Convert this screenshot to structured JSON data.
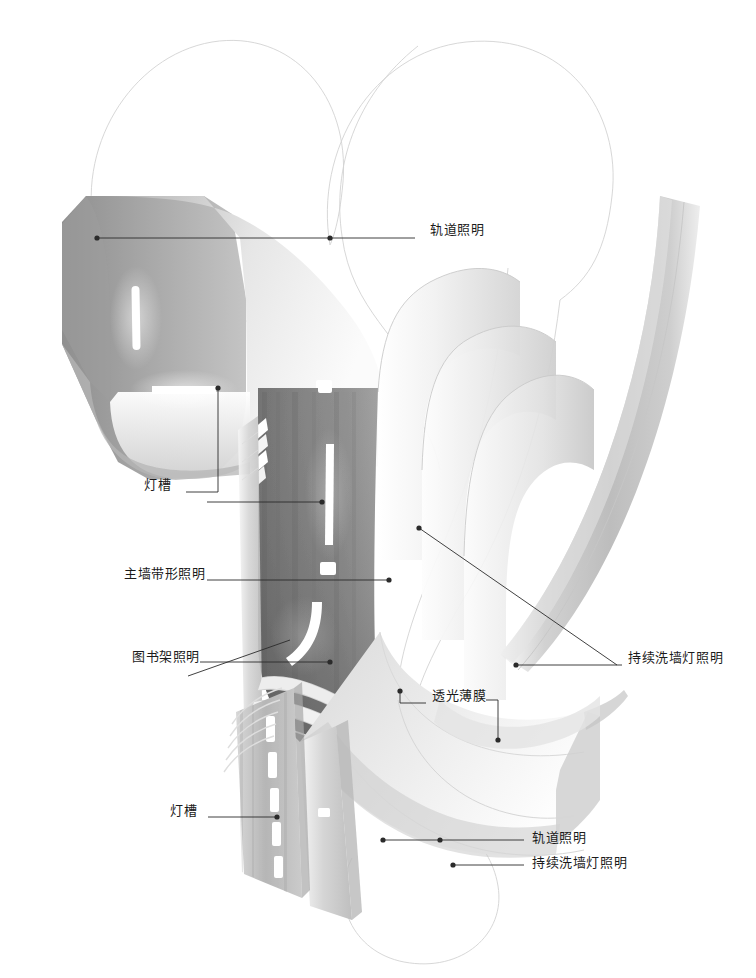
{
  "diagram": {
    "background_color": "#ffffff",
    "leader_color": "#2b2b2b",
    "text_color": "#1b1b1b",
    "callouts": [
      {
        "id": "track-lighting-top",
        "label": "轨道照明",
        "text_x": 430,
        "text_y": 230,
        "dots": [
          [
            97,
            238
          ],
          [
            330,
            238
          ]
        ],
        "leader": "M97,238 L415,238"
      },
      {
        "id": "light-trough-upper",
        "label": "灯槽",
        "text_x": 144,
        "text_y": 485,
        "dots": [
          [
            218,
            388
          ]
        ],
        "leader": "M218,388 L218,492 L186,492"
      },
      {
        "id": "main-wall-linear-lighting",
        "label": "主墙带形照明",
        "text_x": 124,
        "text_y": 574,
        "dots": [
          [
            322,
            502
          ],
          [
            389,
            580
          ]
        ],
        "leader": "M207,580 L389,580 M207,502 L322,502"
      },
      {
        "id": "bookshelf-lighting",
        "label": "图书架照明",
        "text_x": 132,
        "text_y": 657,
        "dots": [
          [
            330,
            662
          ]
        ],
        "leader": "M200,662 L330,662 M290,640 L188,676"
      },
      {
        "id": "continuous-wall-washer-mid",
        "label": "持续洗墙灯照明",
        "text_x": 628,
        "text_y": 658,
        "dots": [
          [
            419,
            528
          ],
          [
            516,
            665
          ]
        ],
        "leader": "M419,528 L617,665 M516,665 L622,665"
      },
      {
        "id": "translucent-membrane",
        "label": "透光薄膜",
        "text_x": 432,
        "text_y": 696,
        "dots": [
          [
            400,
            691
          ],
          [
            498,
            740
          ]
        ],
        "leader": "M400,691 L400,703 L426,703 M486,700 L498,700 L498,740"
      },
      {
        "id": "light-trough-lower",
        "label": "灯槽",
        "text_x": 170,
        "text_y": 811,
        "dots": [
          [
            277,
            817
          ]
        ],
        "leader": "M208,817 L277,817"
      },
      {
        "id": "track-lighting-bottom",
        "label": "轨道照明",
        "text_x": 532,
        "text_y": 838,
        "dots": [
          [
            383,
            840
          ],
          [
            440,
            840
          ]
        ],
        "leader": "M383,840 L524,840"
      },
      {
        "id": "continuous-wall-washer-bottom",
        "label": "持续洗墙灯照明",
        "text_x": 532,
        "text_y": 863,
        "dots": [
          [
            453,
            865
          ]
        ],
        "leader": "M453,865 L524,865"
      }
    ],
    "scene": {
      "description": "弧形异型墙面与天花剖面渲染",
      "ghost_outline_color": "#cfcfcf",
      "surfaces": [
        {
          "name": "upper-ceiling-panel",
          "tone": "#c9c9c9"
        },
        {
          "name": "main-dark-wall",
          "tone": "#7d7d7d"
        },
        {
          "name": "layered-ribbon-fins",
          "tone": "#e8e8e8"
        },
        {
          "name": "right-curved-column",
          "tone": "#cdcdcd"
        },
        {
          "name": "lower-floor-sweep",
          "tone": "#d8d8d8"
        },
        {
          "name": "louver-slat-wall",
          "tone": "#bcbcbc"
        }
      ]
    }
  }
}
